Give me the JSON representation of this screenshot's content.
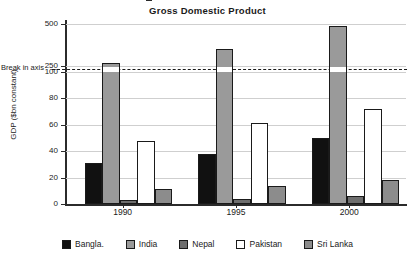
{
  "chart_data": {
    "type": "bar",
    "title": "Gross Domestic Product",
    "xlabel": "",
    "ylabel": "GDP ($bn constant)",
    "categories": [
      "1990",
      "1995",
      "2000"
    ],
    "series": [
      {
        "name": "Bangla.",
        "color": "#111111",
        "values": [
          31,
          38,
          50
        ]
      },
      {
        "name": "India",
        "color": "#9a9a9a",
        "values": [
          270,
          350,
          490
        ]
      },
      {
        "name": "Nepal",
        "color": "#6e6e6e",
        "values": [
          3,
          4,
          6
        ]
      },
      {
        "name": "Pakistan",
        "color": "#ffffff",
        "values": [
          48,
          61,
          72
        ]
      },
      {
        "name": "Sri Lanka",
        "color": "#8c8c8c",
        "values": [
          11,
          14,
          18
        ]
      }
    ],
    "ytick_labels": [
      "0",
      "20",
      "40",
      "60",
      "80",
      "100",
      "250",
      "500"
    ],
    "ytick_values": [
      0,
      20,
      40,
      60,
      80,
      100,
      250,
      500
    ],
    "axis_break": {
      "label": "Break in axis",
      "below": 100,
      "above": 250
    },
    "ylim": [
      0,
      500
    ],
    "grid": true,
    "legend_position": "bottom"
  },
  "legend": {
    "items": [
      {
        "label": "Bangla."
      },
      {
        "label": "India"
      },
      {
        "label": "Nepal"
      },
      {
        "label": "Pakistan"
      },
      {
        "label": "Sri Lanka"
      }
    ]
  }
}
